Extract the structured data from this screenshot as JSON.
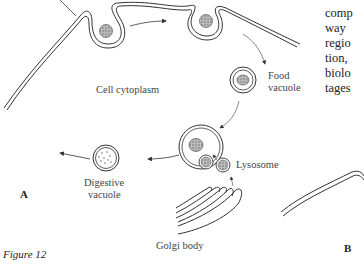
{
  "diagram": {
    "labels": {
      "cytoplasm": "Cell cytoplasm",
      "food_vacuole_1": "Food",
      "food_vacuole_2": "vacuole",
      "digestive_vacuole_1": "Digestive",
      "digestive_vacuole_2": "vacuole",
      "lysosome": "Lysosome",
      "golgi": "Golgi body"
    },
    "panels": {
      "a": "A",
      "b": "B"
    },
    "caption": "Figure 12"
  },
  "body_text": {
    "lines": [
      "comp",
      "way",
      "regio",
      "tion,",
      "biolo",
      "tages"
    ]
  }
}
